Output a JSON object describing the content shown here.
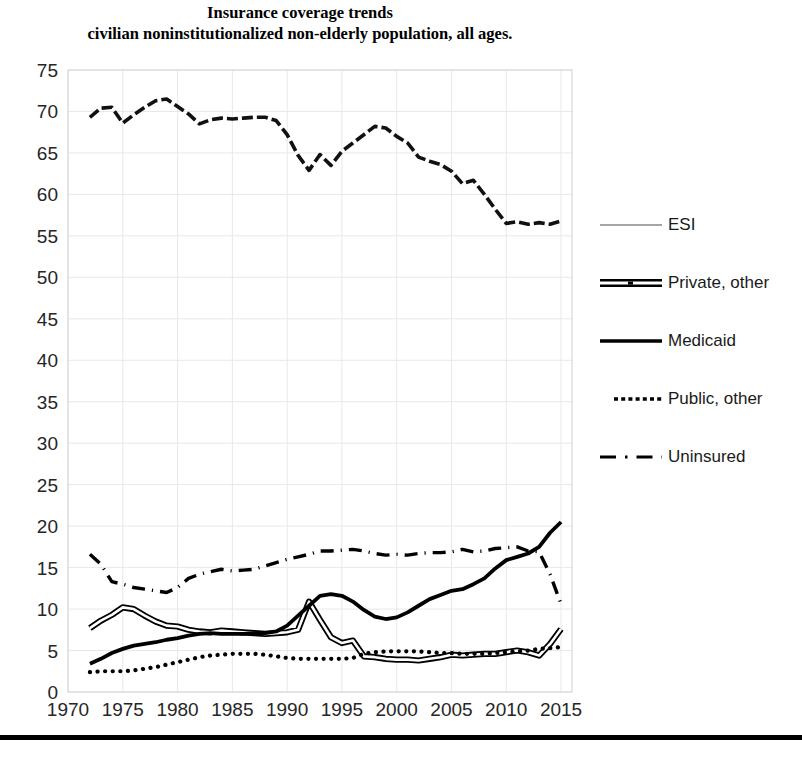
{
  "title": {
    "line1": "Insurance coverage trends",
    "line2": "civilian noninstitutionalized non-elderly population, all ages."
  },
  "legend": {
    "position": "right",
    "items": [
      {
        "label": "ESI",
        "style": "solid-gray",
        "color": "#a6a6a6"
      },
      {
        "label": "Private, other",
        "style": "double-line",
        "color": "#000000"
      },
      {
        "label": "Medicaid",
        "style": "solid",
        "color": "#000000"
      },
      {
        "label": "Public, other",
        "style": "dotted",
        "color": "#000000"
      },
      {
        "label": "Uninsured",
        "style": "dash-dot",
        "color": "#000000"
      }
    ]
  },
  "axes": {
    "y_ticks": [
      "0",
      "5",
      "10",
      "15",
      "20",
      "25",
      "30",
      "35",
      "40",
      "45",
      "50",
      "55",
      "60",
      "65",
      "70",
      "75"
    ],
    "x_ticks": [
      "1970",
      "1975",
      "1980",
      "1985",
      "1990",
      "1995",
      "2000",
      "2005",
      "2010",
      "2015"
    ]
  },
  "chart_data": {
    "type": "line",
    "title": "Insurance coverage trends civilian noninstitutionalized non-elderly population, all ages.",
    "xlabel": "",
    "ylabel": "",
    "xlim": [
      1970,
      2016
    ],
    "ylim": [
      0,
      75
    ],
    "grid": true,
    "legend_position": "right",
    "x": [
      1972,
      1973,
      1974,
      1975,
      1976,
      1977,
      1978,
      1979,
      1980,
      1981,
      1982,
      1983,
      1984,
      1985,
      1986,
      1987,
      1988,
      1989,
      1990,
      1991,
      1992,
      1993,
      1994,
      1995,
      1996,
      1997,
      1998,
      1999,
      2000,
      2001,
      2002,
      2003,
      2004,
      2005,
      2006,
      2007,
      2008,
      2009,
      2010,
      2011,
      2012,
      2013,
      2014,
      2015
    ],
    "series": [
      {
        "name": "ESI",
        "style": "solid-gray",
        "color": "#a6a6a6",
        "values": [
          69.3,
          70.4,
          70.5,
          68.6,
          69.6,
          70.5,
          71.3,
          71.5,
          70.6,
          69.7,
          68.5,
          69.0,
          69.2,
          69.1,
          69.2,
          69.3,
          69.3,
          68.9,
          67.2,
          64.7,
          62.9,
          64.8,
          63.5,
          65.2,
          66.2,
          67.2,
          68.2,
          68.0,
          67.0,
          66.2,
          64.5,
          64.0,
          63.6,
          62.8,
          61.3,
          61.7,
          60.0,
          58.2,
          56.5,
          56.7,
          56.4,
          56.6,
          56.4,
          56.8
        ]
      },
      {
        "name": "Private, other",
        "style": "double-line",
        "color": "#000000",
        "values": [
          7.7,
          8.6,
          9.3,
          10.2,
          10.0,
          9.2,
          8.5,
          8.0,
          7.9,
          7.5,
          7.3,
          7.2,
          7.4,
          7.3,
          7.2,
          7.1,
          7.0,
          7.1,
          7.2,
          7.5,
          10.9,
          8.7,
          6.6,
          5.9,
          6.2,
          4.3,
          4.2,
          4.0,
          3.9,
          3.9,
          3.8,
          4.0,
          4.2,
          4.5,
          4.4,
          4.5,
          4.6,
          4.6,
          4.8,
          5.0,
          4.8,
          4.4,
          5.8,
          7.6
        ]
      },
      {
        "name": "Medicaid",
        "style": "solid",
        "color": "#000000",
        "values": [
          3.4,
          4.0,
          4.7,
          5.2,
          5.6,
          5.8,
          6.0,
          6.3,
          6.5,
          6.8,
          7.0,
          7.1,
          7.0,
          7.0,
          7.0,
          7.1,
          7.1,
          7.3,
          8.0,
          9.2,
          10.4,
          11.6,
          11.8,
          11.6,
          10.9,
          9.9,
          9.1,
          8.8,
          9.0,
          9.6,
          10.4,
          11.2,
          11.7,
          12.2,
          12.4,
          13.0,
          13.7,
          14.9,
          15.9,
          16.3,
          16.7,
          17.5,
          19.2,
          20.5
        ]
      },
      {
        "name": "Public, other",
        "style": "dotted",
        "color": "#000000",
        "values": [
          2.4,
          2.5,
          2.5,
          2.5,
          2.6,
          2.8,
          3.0,
          3.3,
          3.6,
          3.9,
          4.2,
          4.4,
          4.5,
          4.6,
          4.6,
          4.6,
          4.5,
          4.3,
          4.1,
          4.0,
          4.0,
          4.0,
          4.0,
          4.0,
          4.1,
          4.6,
          4.8,
          4.9,
          4.9,
          4.9,
          4.9,
          4.8,
          4.7,
          4.7,
          4.6,
          4.6,
          4.6,
          4.7,
          4.8,
          4.9,
          5.0,
          5.2,
          5.3,
          5.4
        ]
      },
      {
        "name": "Uninsured",
        "style": "dash-dot",
        "color": "#000000",
        "values": [
          16.6,
          15.4,
          13.3,
          13.0,
          12.6,
          12.4,
          12.2,
          12.0,
          12.6,
          13.7,
          14.2,
          14.5,
          14.8,
          14.6,
          14.7,
          14.8,
          15.2,
          15.6,
          16.0,
          16.3,
          16.6,
          17.0,
          17.0,
          17.1,
          17.2,
          17.0,
          16.7,
          16.5,
          16.6,
          16.5,
          16.7,
          16.8,
          16.8,
          16.9,
          17.2,
          16.9,
          17.0,
          17.3,
          17.4,
          17.5,
          17.0,
          16.9,
          14.2,
          10.6
        ]
      }
    ]
  }
}
